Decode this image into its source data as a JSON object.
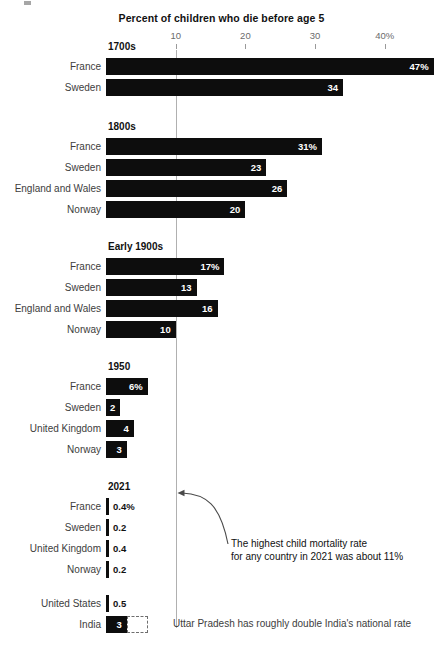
{
  "chart_data": {
    "type": "bar",
    "title": "Percent of children who die before age 5",
    "xlabel": "",
    "ylabel": "",
    "orientation": "horizontal",
    "xlim": [
      0,
      50
    ],
    "grid": true,
    "gridline_at": 10,
    "legend": "none",
    "axis_ticks": [
      {
        "value": 10,
        "label": "10"
      },
      {
        "value": 20,
        "label": "20"
      },
      {
        "value": 30,
        "label": "30"
      },
      {
        "value": 40,
        "label": "40%"
      }
    ],
    "groups": [
      {
        "label": "1700s",
        "rows": [
          {
            "category": "France",
            "value": 47,
            "data_label": "47%",
            "label_position": "inside"
          },
          {
            "category": "Sweden",
            "value": 34,
            "data_label": "34",
            "label_position": "inside"
          }
        ]
      },
      {
        "label": "1800s",
        "rows": [
          {
            "category": "France",
            "value": 31,
            "data_label": "31%",
            "label_position": "inside"
          },
          {
            "category": "Sweden",
            "value": 23,
            "data_label": "23",
            "label_position": "inside"
          },
          {
            "category": "England and Wales",
            "value": 26,
            "data_label": "26",
            "label_position": "inside"
          },
          {
            "category": "Norway",
            "value": 20,
            "data_label": "20",
            "label_position": "inside"
          }
        ]
      },
      {
        "label": "Early 1900s",
        "rows": [
          {
            "category": "France",
            "value": 17,
            "data_label": "17%",
            "label_position": "inside"
          },
          {
            "category": "Sweden",
            "value": 13,
            "data_label": "13",
            "label_position": "inside"
          },
          {
            "category": "England and Wales",
            "value": 16,
            "data_label": "16",
            "label_position": "inside"
          },
          {
            "category": "Norway",
            "value": 10,
            "data_label": "10",
            "label_position": "inside"
          }
        ]
      },
      {
        "label": "1950",
        "rows": [
          {
            "category": "France",
            "value": 6,
            "data_label": "6%",
            "label_position": "inside"
          },
          {
            "category": "Sweden",
            "value": 2,
            "data_label": "2",
            "label_position": "inside"
          },
          {
            "category": "United Kingdom",
            "value": 4,
            "data_label": "4",
            "label_position": "inside"
          },
          {
            "category": "Norway",
            "value": 3,
            "data_label": "3",
            "label_position": "inside"
          }
        ]
      },
      {
        "label": "2021",
        "rows": [
          {
            "category": "France",
            "value": 0.4,
            "data_label": "0.4%",
            "label_position": "outside"
          },
          {
            "category": "Sweden",
            "value": 0.2,
            "data_label": "0.2",
            "label_position": "outside"
          },
          {
            "category": "United Kingdom",
            "value": 0.4,
            "data_label": "0.4",
            "label_position": "outside"
          },
          {
            "category": "Norway",
            "value": 0.2,
            "data_label": "0.2",
            "label_position": "outside"
          },
          {
            "category": "United States",
            "value": 0.5,
            "data_label": "0.5",
            "label_position": "outside"
          },
          {
            "category": "India",
            "value": 3,
            "data_label": "3",
            "label_position": "inside"
          }
        ]
      }
    ],
    "annotations": [
      {
        "id": "highest-rate",
        "line1": "The highest child mortality rate",
        "line2": "for any country in 2021 was about 11%",
        "points_to": "gridline at 10 percent"
      },
      {
        "id": "uttar-pradesh",
        "text": "Uttar Pradesh has roughly double India's national rate",
        "points_to": "India bar dashed extension"
      }
    ],
    "colors": {
      "bar": "#0d0d0d",
      "background": "#ffffff",
      "gridline": "#b0b0b0",
      "tick_label": "#6b6b6b",
      "category_label": "#3d3d3d",
      "value_label_inside": "#ffffff",
      "value_label_outside": "#111111"
    }
  }
}
